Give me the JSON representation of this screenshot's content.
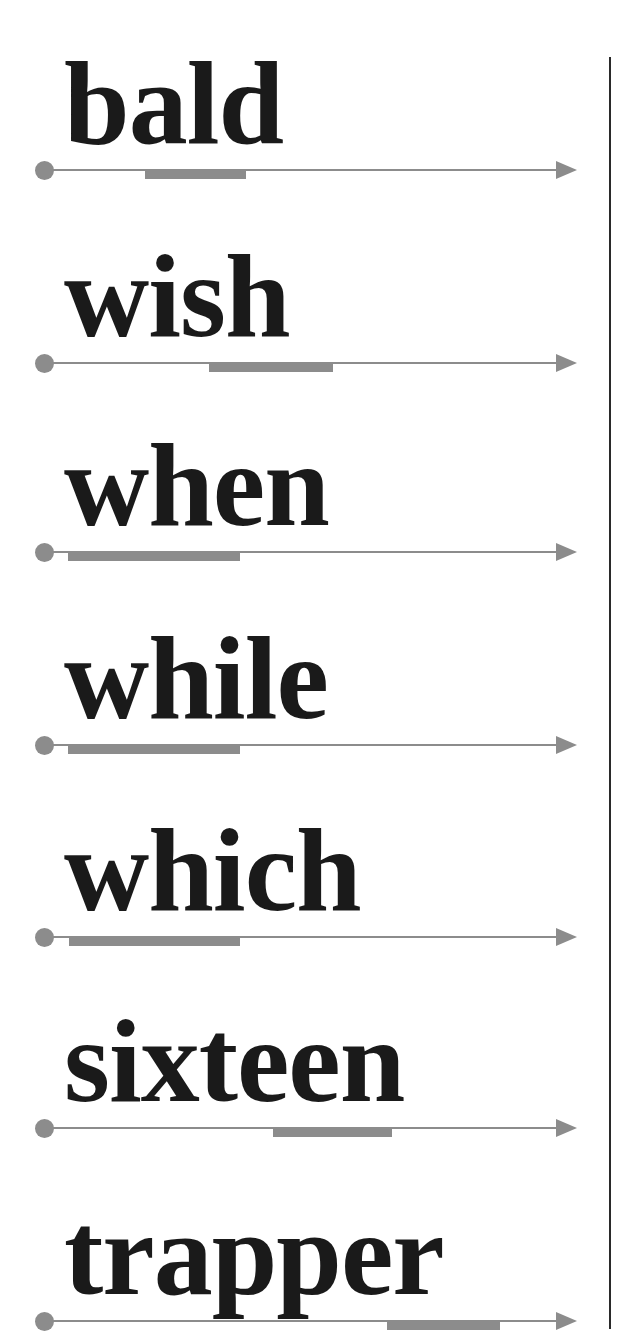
{
  "colors": {
    "text": "#1a1a1a",
    "line": "#8c8c8c",
    "divider": "#2a2a2a"
  },
  "rows": [
    {
      "word": "bald",
      "line_y": 170,
      "bar_x": 145,
      "bar_w": 101
    },
    {
      "word": "wish",
      "line_y": 363,
      "bar_x": 209,
      "bar_w": 124
    },
    {
      "word": "when",
      "line_y": 552,
      "bar_x": 68,
      "bar_w": 172
    },
    {
      "word": "while",
      "line_y": 745,
      "bar_x": 68,
      "bar_w": 172
    },
    {
      "word": "which",
      "line_y": 937,
      "bar_x": 69,
      "bar_w": 171
    },
    {
      "word": "sixteen",
      "line_y": 1128,
      "bar_x": 273,
      "bar_w": 119
    },
    {
      "word": "trapper",
      "line_y": 1321,
      "bar_x": 387,
      "bar_w": 113
    }
  ]
}
